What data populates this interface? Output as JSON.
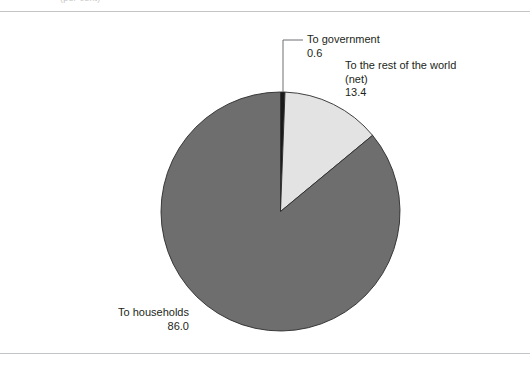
{
  "figure": {
    "caption_remnant": "(per cent)",
    "background_color": "#ffffff",
    "rule_color": "#c2c4c6"
  },
  "chart_data": {
    "type": "pie",
    "title": "",
    "subtitle": "",
    "xlabel": "",
    "ylabel": "",
    "legend_position": "none",
    "grid": false,
    "units": "per cent",
    "start_angle_deg": 0,
    "direction": "clockwise",
    "total": 100.0,
    "categories": [
      "To government",
      "To the rest of the world (net)",
      "To households"
    ],
    "values": [
      0.6,
      13.4,
      86.0
    ],
    "colors": [
      "#1a1a1a",
      "#e3e3e3",
      "#6e6e6e"
    ],
    "slices": [
      {
        "label": "To government",
        "label_line1": "To government",
        "label_line2": "",
        "value": 0.6,
        "value_text": "0.6",
        "color": "#1a1a1a",
        "leader_line": true
      },
      {
        "label": "To the rest of the world (net)",
        "label_line1": "To the rest of the world",
        "label_line2": "(net)",
        "value": 13.4,
        "value_text": "13.4",
        "color": "#e3e3e3",
        "leader_line": false
      },
      {
        "label": "To households",
        "label_line1": "To households",
        "label_line2": "",
        "value": 86.0,
        "value_text": "86.0",
        "color": "#6e6e6e",
        "leader_line": false
      }
    ]
  }
}
